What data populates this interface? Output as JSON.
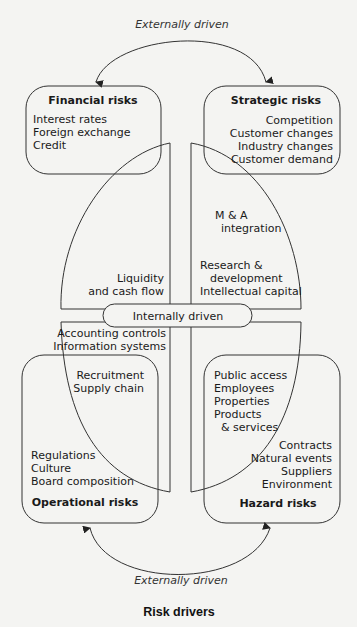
{
  "caption": "Risk drivers",
  "external_top": "Externally driven",
  "external_bottom": "Externally driven",
  "internal": "Internally driven",
  "financial": {
    "title": "Financial risks",
    "items": [
      "Interest rates",
      "Foreign exchange",
      "Credit"
    ]
  },
  "strategic": {
    "title": "Strategic risks",
    "items": [
      "Competition",
      "Customer changes",
      "Industry changes",
      "Customer demand"
    ]
  },
  "operational": {
    "title": "Operational risks",
    "items": [
      "Regulations",
      "Culture",
      "Board composition"
    ]
  },
  "hazard": {
    "title": "Hazard risks",
    "items": [
      "Contracts",
      "Natural events",
      "Suppliers",
      "Environment"
    ]
  },
  "internal_quadrants": {
    "top_left": [
      "Liquidity",
      "and cash flow"
    ],
    "top_right": [
      "Research &",
      "development",
      "Intellectual capital"
    ],
    "strategic_overlap": [
      "M & A",
      "integration"
    ],
    "bottom_left": [
      "Accounting controls",
      "Information systems"
    ],
    "operational_overlap": [
      "Recruitment",
      "Supply chain"
    ],
    "hazard_overlap": [
      "Public access",
      "Employees",
      "Properties",
      "Products",
      "& services"
    ]
  }
}
